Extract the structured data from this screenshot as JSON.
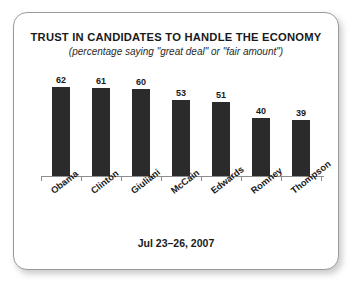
{
  "card": {
    "title": "TRUST IN CANDIDATES TO HANDLE THE ECONOMY",
    "subtitle": "(percentage saying \"great deal\" or \"fair amount\")",
    "footer": "Jul 23–26, 2007"
  },
  "colors": {
    "bar": "#2b2b2b",
    "axis": "#8e8e8e",
    "card_border": "#9a9a9a",
    "text": "#1a1a1a",
    "background": "#ffffff"
  },
  "chart_data": {
    "type": "bar",
    "title": "TRUST IN CANDIDATES TO HANDLE THE ECONOMY",
    "subtitle": "(percentage saying \"great deal\" or \"fair amount\")",
    "footnote": "Jul 23–26, 2007",
    "categories": [
      "Obama",
      "Clinton",
      "Giuliani",
      "McCain",
      "Edwards",
      "Romney",
      "Thompson"
    ],
    "values": [
      62,
      61,
      60,
      53,
      51,
      40,
      39
    ],
    "xlabel": "",
    "ylabel": "",
    "ylim": [
      0,
      70
    ],
    "grid": false,
    "legend": false,
    "value_labels": [
      "62",
      "61",
      "60",
      "53",
      "51",
      "40",
      "39"
    ],
    "orientation": "vertical",
    "units": "percent"
  }
}
